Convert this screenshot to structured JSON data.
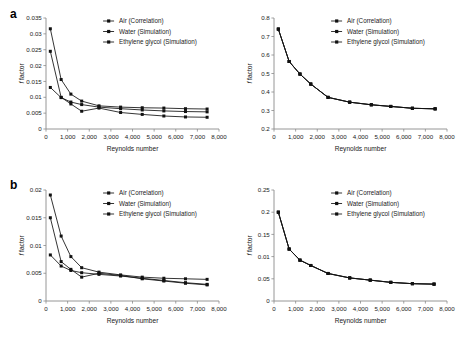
{
  "figure": {
    "panels": [
      {
        "label": "a"
      },
      {
        "label": "b"
      }
    ]
  },
  "legend": {
    "items": [
      {
        "label": "Air (Correlation)",
        "marker": "square-line-marker"
      },
      {
        "label": "Water (Simulation)",
        "marker": "square-line-marker"
      },
      {
        "label": "Ethylene glycol (Simulation)",
        "marker": "square-line-marker"
      }
    ]
  },
  "axis_titles": {
    "x": "Reynolds number",
    "y_italic": "f",
    "y_rest": " factor"
  },
  "chart_data": [
    {
      "id": "panel-a-left",
      "type": "line",
      "title": "",
      "xlabel": "Reynolds number",
      "ylabel": "f factor",
      "xlim": [
        0,
        8000
      ],
      "ylim": [
        0,
        0.035
      ],
      "xticks": [
        0,
        1000,
        2000,
        3000,
        4000,
        5000,
        6000,
        7000,
        8000
      ],
      "xticklabels": [
        "0",
        "1,000",
        "2,000",
        "3,000",
        "4,000",
        "5,000",
        "6,000",
        "7,000",
        "8,000"
      ],
      "yticks": [
        0,
        0.005,
        0.01,
        0.015,
        0.02,
        0.025,
        0.03,
        0.035
      ],
      "yticklabels": [
        "0",
        "0.005",
        "0.01",
        "0.015",
        "0.02",
        "0.025",
        "0.03",
        "0.035"
      ],
      "grid": false,
      "legend_position": "top-right",
      "series": [
        {
          "name": "Air (Correlation)",
          "x": [
            200,
            700,
            1150,
            1650,
            2450,
            3450,
            4450,
            5450,
            6450,
            7450
          ],
          "values": [
            0.0131,
            0.0099,
            0.0085,
            0.0077,
            0.0069,
            0.0064,
            0.006,
            0.0057,
            0.0055,
            0.0054
          ]
        },
        {
          "name": "Water (Simulation)",
          "x": [
            200,
            700,
            1150,
            1650,
            2450,
            3450,
            4450,
            5450,
            6450,
            7450
          ],
          "values": [
            0.0245,
            0.01,
            0.0079,
            0.0056,
            0.0066,
            0.0052,
            0.0046,
            0.0041,
            0.0038,
            0.0037
          ]
        },
        {
          "name": "Ethylene glycol (Simulation)",
          "x": [
            200,
            700,
            1150,
            1650,
            2450,
            3450,
            4450,
            5450,
            6450,
            7450
          ],
          "values": [
            0.0316,
            0.0156,
            0.011,
            0.0088,
            0.0073,
            0.0069,
            0.0067,
            0.0066,
            0.0064,
            0.0063
          ]
        }
      ]
    },
    {
      "id": "panel-a-right",
      "type": "line",
      "title": "",
      "xlabel": "Reynolds number",
      "ylabel": "f factor",
      "xlim": [
        0,
        8000
      ],
      "ylim": [
        0.2,
        0.8
      ],
      "xticks": [
        0,
        1000,
        2000,
        3000,
        4000,
        5000,
        6000,
        7000,
        8000
      ],
      "xticklabels": [
        "0",
        "1,000",
        "2,000",
        "3,000",
        "4,000",
        "5,000",
        "6,000",
        "7,000",
        "8,000"
      ],
      "yticks": [
        0.2,
        0.3,
        0.4,
        0.5,
        0.6,
        0.7,
        0.8
      ],
      "yticklabels": [
        "0.2",
        "0.3",
        "0.4",
        "0.5",
        "0.6",
        "0.7",
        "0.8"
      ],
      "grid": false,
      "legend_position": "top-right",
      "series": [
        {
          "name": "Air (Correlation)",
          "x": [
            200,
            700,
            1200,
            1700,
            2500,
            3500,
            4500,
            5400,
            6400,
            7450
          ],
          "values": [
            0.74,
            0.565,
            0.497,
            0.443,
            0.371,
            0.345,
            0.331,
            0.322,
            0.312,
            0.309
          ]
        },
        {
          "name": "Water (Simulation)",
          "x": [
            200,
            700,
            1200,
            1700,
            2500,
            3500,
            4500,
            5400,
            6400,
            7450
          ],
          "values": [
            0.74,
            0.565,
            0.497,
            0.443,
            0.371,
            0.345,
            0.331,
            0.322,
            0.312,
            0.309
          ]
        },
        {
          "name": "Ethylene glycol (Simulation)",
          "x": [
            200,
            700,
            1200,
            1700,
            2500,
            3500,
            4500,
            5400,
            6400,
            7450
          ],
          "values": [
            0.74,
            0.565,
            0.497,
            0.443,
            0.371,
            0.345,
            0.331,
            0.322,
            0.312,
            0.309
          ]
        }
      ]
    },
    {
      "id": "panel-b-left",
      "type": "line",
      "title": "",
      "xlabel": "Reynolds number",
      "ylabel": "f factor",
      "xlim": [
        0,
        8000
      ],
      "ylim": [
        0,
        0.02
      ],
      "xticks": [
        0,
        1000,
        2000,
        3000,
        4000,
        5000,
        6000,
        7000,
        8000
      ],
      "xticklabels": [
        "0",
        "1,000",
        "2,000",
        "3,000",
        "4,000",
        "5,000",
        "6,000",
        "7,000",
        "8,000"
      ],
      "yticks": [
        0,
        0.005,
        0.01,
        0.015,
        0.02
      ],
      "yticklabels": [
        "0",
        "0.005",
        "0.01",
        "0.015",
        "0.02"
      ],
      "grid": false,
      "legend_position": "top-right",
      "series": [
        {
          "name": "Air (Correlation)",
          "x": [
            200,
            700,
            1150,
            1650,
            2450,
            3450,
            4450,
            5450,
            6450,
            7450
          ],
          "values": [
            0.0083,
            0.0063,
            0.0055,
            0.0051,
            0.0048,
            0.0045,
            0.0041,
            0.0037,
            0.0033,
            0.003
          ]
        },
        {
          "name": "Water (Simulation)",
          "x": [
            200,
            700,
            1150,
            1650,
            2450,
            3450,
            4450,
            5450,
            6450,
            7450
          ],
          "values": [
            0.015,
            0.0071,
            0.0057,
            0.0043,
            0.005,
            0.0046,
            0.004,
            0.0036,
            0.0032,
            0.0029
          ]
        },
        {
          "name": "Ethylene glycol (Simulation)",
          "x": [
            200,
            700,
            1150,
            1650,
            2450,
            3450,
            4450,
            5450,
            6450,
            7450
          ],
          "values": [
            0.0191,
            0.0117,
            0.008,
            0.006,
            0.0052,
            0.0047,
            0.0043,
            0.0041,
            0.004,
            0.0039
          ]
        }
      ]
    },
    {
      "id": "panel-b-right",
      "type": "line",
      "title": "",
      "xlabel": "Reynolds number",
      "ylabel": "f factor",
      "xlim": [
        0,
        8000
      ],
      "ylim": [
        0,
        0.25
      ],
      "xticks": [
        0,
        1000,
        2000,
        3000,
        4000,
        5000,
        6000,
        7000,
        8000
      ],
      "xticklabels": [
        "0",
        "1,000",
        "2,000",
        "3,000",
        "4,000",
        "5,000",
        "6,000",
        "7,000",
        "8,000"
      ],
      "yticks": [
        0,
        0.05,
        0.1,
        0.15,
        0.2,
        0.25
      ],
      "yticklabels": [
        "0",
        "0.05",
        "0.01",
        "0.15",
        "0.2",
        "0.25"
      ],
      "grid": false,
      "legend_position": "top-right",
      "series": [
        {
          "name": "Air (Correlation)",
          "x": [
            200,
            700,
            1200,
            1700,
            2500,
            3500,
            4450,
            5400,
            6400,
            7400
          ],
          "values": [
            0.2,
            0.117,
            0.092,
            0.08,
            0.062,
            0.052,
            0.047,
            0.042,
            0.039,
            0.038
          ]
        },
        {
          "name": "Water (Simulation)",
          "x": [
            200,
            700,
            1200,
            1700,
            2500,
            3500,
            4450,
            5400,
            6400,
            7400
          ],
          "values": [
            0.2,
            0.117,
            0.092,
            0.08,
            0.062,
            0.052,
            0.047,
            0.042,
            0.039,
            0.038
          ]
        },
        {
          "name": "Ethylene glycol (Simulation)",
          "x": [
            200,
            700,
            1200,
            1700,
            2500,
            3500,
            4450,
            5400,
            6400,
            7400
          ],
          "values": [
            0.2,
            0.117,
            0.092,
            0.08,
            0.062,
            0.052,
            0.047,
            0.042,
            0.039,
            0.038
          ]
        }
      ]
    }
  ]
}
